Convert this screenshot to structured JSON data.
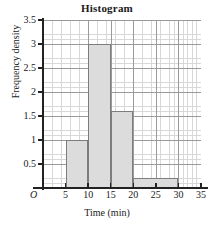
{
  "chart_data": {
    "type": "bar",
    "title": "Histogram",
    "xlabel": "Time (min)",
    "ylabel": "Frequency density",
    "origin_label": "O",
    "xlim": [
      0,
      35
    ],
    "ylim": [
      0,
      3.5
    ],
    "grid": true,
    "legend": "none",
    "x_ticks": [
      0,
      5,
      10,
      15,
      20,
      25,
      30,
      35
    ],
    "x_ticklabels": [
      "0",
      "5",
      "10",
      "15",
      "20",
      "25",
      "30",
      "35"
    ],
    "y_ticks": [
      0.5,
      1,
      1.5,
      2,
      2.5,
      3,
      3.5
    ],
    "y_ticklabels": [
      "0.5",
      "1",
      "1.5",
      "2",
      "2.5",
      "3",
      "3.5"
    ],
    "bars": [
      {
        "label": "5-10",
        "start": 5,
        "end": 10,
        "value": 1
      },
      {
        "label": "10-15",
        "start": 10,
        "end": 15,
        "value": 3
      },
      {
        "label": "15-20",
        "start": 15,
        "end": 20,
        "value": 1.6
      },
      {
        "label": "20-30",
        "start": 20,
        "end": 30,
        "value": 0.2
      }
    ],
    "categories": [
      "5-10",
      "10-15",
      "15-20",
      "20-30"
    ],
    "values": [
      1,
      3,
      1.6,
      0.2
    ],
    "colors": {
      "bar_fill": "#dcdcdc",
      "bar_edge": "#7d7d7d",
      "grid_minor": "#d8d8d8",
      "grid_major": "#9a9a9a",
      "axis": "#222222",
      "background": "#ffffff"
    }
  }
}
